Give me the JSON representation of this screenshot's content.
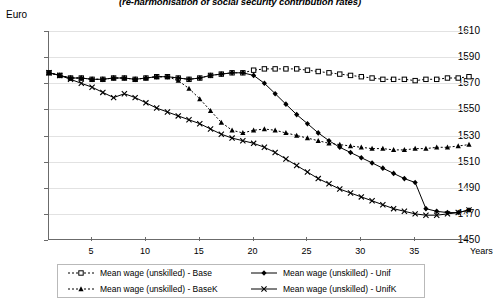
{
  "chart_data": {
    "type": "line",
    "title": "(re-harmonisation of social security contribution rates)",
    "ylabel": "Euro",
    "xlabel": "Years",
    "ylim": [
      1450,
      1610
    ],
    "ytick_labels": [
      "1610",
      "1590",
      "1570",
      "1550",
      "1530",
      "1510",
      "1490",
      "1470",
      "1450"
    ],
    "yticks": [
      1610,
      1590,
      1570,
      1550,
      1530,
      1510,
      1490,
      1470,
      1450
    ],
    "xlim": [
      1,
      40
    ],
    "xticks": [
      5,
      10,
      15,
      20,
      25,
      30,
      35
    ],
    "xtick_labels": [
      "5",
      "10",
      "15",
      "20",
      "25",
      "30",
      "35"
    ],
    "grid": true,
    "legend_position": "bottom",
    "x": [
      1,
      2,
      3,
      4,
      5,
      6,
      7,
      8,
      9,
      10,
      11,
      12,
      13,
      14,
      15,
      16,
      17,
      18,
      19,
      20,
      21,
      22,
      23,
      24,
      25,
      26,
      27,
      28,
      29,
      30,
      31,
      32,
      33,
      34,
      35,
      36,
      37,
      38,
      39,
      40
    ],
    "series": [
      {
        "name": "Mean wage (unskilled) - Base",
        "marker": "square",
        "linestyle": "dotted",
        "color": "#000000",
        "values": [
          1578,
          1576,
          1574,
          1574,
          1573,
          1573,
          1574,
          1574,
          1573,
          1574,
          1575,
          1575,
          1574,
          1573,
          1574,
          1576,
          1577,
          1578,
          1578,
          1580,
          1581,
          1581,
          1581,
          1581,
          1580,
          1579,
          1578,
          1577,
          1576,
          1575,
          1574,
          1573,
          1573,
          1573,
          1572,
          1573,
          1573,
          1574,
          1574,
          1575
        ]
      },
      {
        "name": "Mean wage (unskilled) - BaseK",
        "marker": "triangle",
        "linestyle": "dotted",
        "color": "#000000",
        "values": [
          1578,
          1576,
          1574,
          1574,
          1573,
          1573,
          1574,
          1574,
          1573,
          1574,
          1575,
          1575,
          1572,
          1566,
          1558,
          1549,
          1540,
          1534,
          1532,
          1534,
          1535,
          1534,
          1532,
          1530,
          1528,
          1526,
          1524,
          1523,
          1522,
          1521,
          1520,
          1520,
          1519,
          1519,
          1520,
          1520,
          1521,
          1521,
          1522,
          1523
        ]
      },
      {
        "name": "Mean wage (unskilled) - Unif",
        "marker": "diamond",
        "linestyle": "solid",
        "color": "#000000",
        "values": [
          1578,
          1576,
          1574,
          1574,
          1573,
          1573,
          1574,
          1574,
          1573,
          1574,
          1575,
          1575,
          1574,
          1573,
          1574,
          1576,
          1577,
          1578,
          1578,
          1576,
          1570,
          1562,
          1554,
          1546,
          1539,
          1532,
          1526,
          1521,
          1517,
          1513,
          1509,
          1505,
          1501,
          1497,
          1494,
          1474,
          1472,
          1471,
          1471,
          1473
        ]
      },
      {
        "name": "Mean wage (unskilled) - UnifK",
        "marker": "x",
        "linestyle": "solid",
        "color": "#000000",
        "values": [
          1578,
          1576,
          1573,
          1570,
          1567,
          1563,
          1559,
          1562,
          1559,
          1555,
          1551,
          1548,
          1545,
          1542,
          1539,
          1535,
          1531,
          1528,
          1526,
          1524,
          1521,
          1517,
          1512,
          1507,
          1502,
          1497,
          1493,
          1489,
          1486,
          1483,
          1480,
          1477,
          1474,
          1472,
          1470,
          1469,
          1469,
          1470,
          1471,
          1473
        ]
      }
    ]
  }
}
